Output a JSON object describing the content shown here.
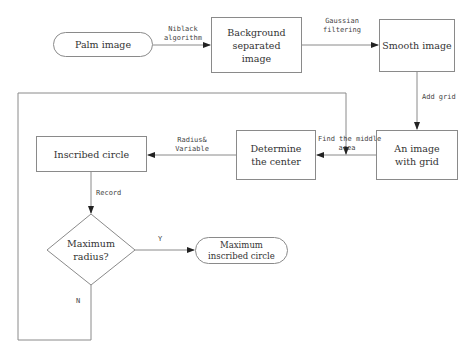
{
  "nodes": {
    "palm_image": "Palm image",
    "background_separated": "Background separated image",
    "smooth_image": "Smooth image",
    "image_with_grid": "An image with grid",
    "determine_center": "Determine the center",
    "inscribed_circle": "Inscribed circle",
    "decision": "Maximum radius?",
    "max_inscribed_circle": "Maximum inscribed circle"
  },
  "edges": {
    "niblack_1": "Niblack",
    "niblack_2": "algorithm",
    "gaussian_1": "Gaussian",
    "gaussian_2": "filtering",
    "add_grid": "Add grid",
    "find_middle_1": "Find the middle",
    "find_middle_2": "area",
    "radius_1": "Radius&",
    "radius_2": "Variable",
    "record": "Record",
    "yes": "Y",
    "no": "N"
  }
}
